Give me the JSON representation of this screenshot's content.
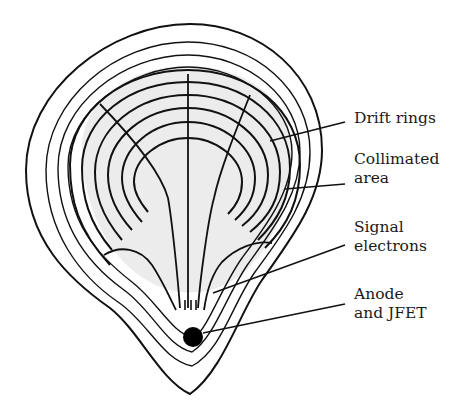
{
  "diagram": {
    "labels": [
      {
        "id": "drift-rings",
        "lines": [
          "Drift rings"
        ]
      },
      {
        "id": "collimated-area",
        "lines": [
          "Collimated",
          "area"
        ]
      },
      {
        "id": "signal-electrons",
        "lines": [
          "Signal",
          "electrons"
        ]
      },
      {
        "id": "anode-jfet",
        "lines": [
          "Anode",
          "and JFET"
        ]
      }
    ],
    "colors": {
      "stroke": "#111111",
      "collimated_fill": "#ececec",
      "anode": "#000000",
      "background": "#ffffff"
    }
  }
}
